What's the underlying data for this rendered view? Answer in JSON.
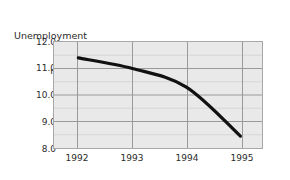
{
  "chart_data": {
    "type": "line",
    "title": "Unemployment rate",
    "title_lines": [
      "Unemployment",
      "rate"
    ],
    "xlabel": "",
    "ylabel": "",
    "x": [
      1992,
      1993,
      1994,
      1995
    ],
    "categories": [
      "1992",
      "1993",
      "1994",
      "1995"
    ],
    "values": [
      11.4,
      11.0,
      10.3,
      8.45
    ],
    "series": [
      {
        "name": "Unemployment rate",
        "values": [
          11.4,
          11.0,
          10.3,
          8.45
        ],
        "color": "#111111"
      }
    ],
    "ylim": [
      8.0,
      12.0
    ],
    "xlim": [
      1991.55,
      1995.4
    ],
    "ytick_labels": [
      "12.0",
      "11.0",
      "10.0",
      "9.0",
      "8.0"
    ],
    "ytick_values": [
      12.0,
      11.0,
      10.0,
      9.0,
      8.0
    ],
    "yminor_values": [
      11.5,
      10.5,
      9.5,
      8.5
    ],
    "xtick_labels": [
      "1992",
      "1993",
      "1994",
      "1995"
    ],
    "xtick_values": [
      1992,
      1993,
      1994,
      1995
    ],
    "grid": "both",
    "legend": "none",
    "plot_background_color": "#e9e9e9",
    "major_gridline_color": "#9a9a9a",
    "minor_gridline_color": "#d6d6d6",
    "frame_color": "#a8a8a8",
    "line_color": "#111111",
    "line_width_px": 3.2,
    "annotations": []
  },
  "yticks": {
    "t0": "12.0",
    "t1": "11.0",
    "t2": "10.0",
    "t3": "9.0",
    "t4": "8.0"
  },
  "xticks": {
    "t0": "1992",
    "t1": "1993",
    "t2": "1994",
    "t3": "1995"
  },
  "title": {
    "line1": "Unemployment",
    "line2": "rate"
  }
}
